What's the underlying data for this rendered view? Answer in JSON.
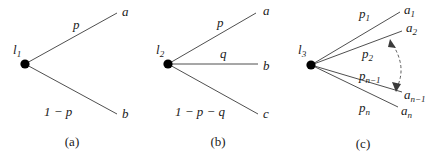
{
  "figure": {
    "kind": "probability-tree-diagram",
    "background_color": "#ffffff",
    "line_color": "#3b3b3b",
    "text_color": "#1a1a1a",
    "panels": [
      {
        "id": "a",
        "caption": "(a)",
        "root_label": "l",
        "root_subscript": "1",
        "branches": [
          {
            "prob_label": "p",
            "prob_sub": "",
            "leaf_label": "a",
            "leaf_sub": ""
          },
          {
            "prob_label": "1 − p",
            "prob_sub": "",
            "leaf_label": "b",
            "leaf_sub": ""
          }
        ]
      },
      {
        "id": "b",
        "caption": "(b)",
        "root_label": "l",
        "root_subscript": "2",
        "branches": [
          {
            "prob_label": "p",
            "prob_sub": "",
            "leaf_label": "a",
            "leaf_sub": ""
          },
          {
            "prob_label": "q",
            "prob_sub": "",
            "leaf_label": "b",
            "leaf_sub": ""
          },
          {
            "prob_label": "1 − p − q",
            "prob_sub": "",
            "leaf_label": "c",
            "leaf_sub": ""
          }
        ]
      },
      {
        "id": "c",
        "caption": "(c)",
        "root_label": "l",
        "root_subscript": "3",
        "branches": [
          {
            "prob_label": "p",
            "prob_sub": "1",
            "leaf_label": "a",
            "leaf_sub": "1"
          },
          {
            "prob_label": "p",
            "prob_sub": "2",
            "leaf_label": "a",
            "leaf_sub": "2"
          },
          {
            "prob_label": "p",
            "prob_sub": "n−1",
            "leaf_label": "a",
            "leaf_sub": "n−1"
          },
          {
            "prob_label": "p",
            "prob_sub": "n",
            "leaf_label": "a",
            "leaf_sub": "n"
          }
        ],
        "ellipsis_arc": "dashed-double-headed-arc"
      }
    ]
  }
}
